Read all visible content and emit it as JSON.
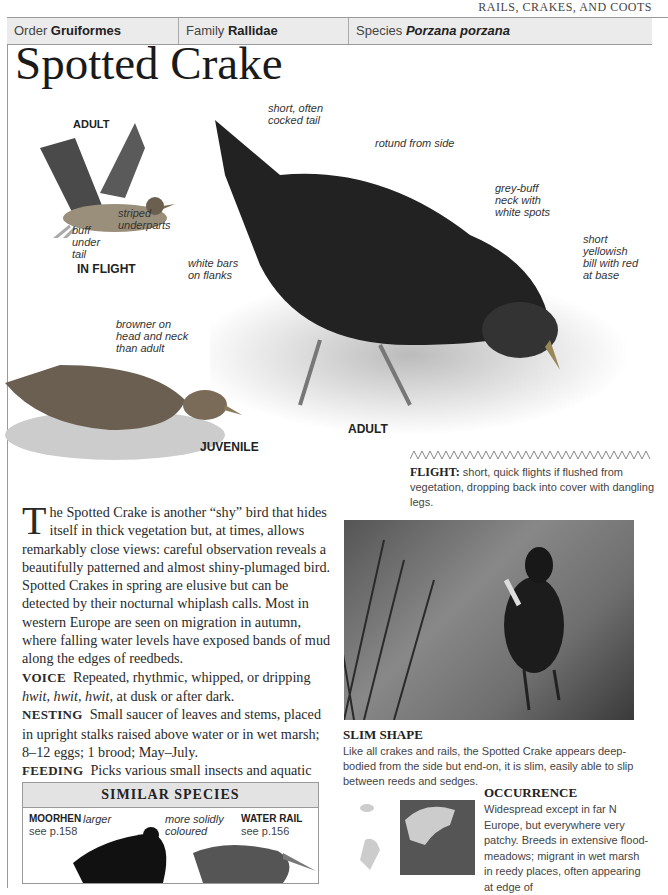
{
  "running_head": "RAILS, CRAKES, AND COOTS",
  "taxonomy": {
    "order_label": "Order",
    "order": "Gruiformes",
    "family_label": "Family",
    "family": "Rallidae",
    "species_label": "Species",
    "species": "Porzana porzana"
  },
  "title": "Spotted Crake",
  "illustrations": {
    "flight": {
      "top_label": "ADULT",
      "caption": "IN FLIGHT",
      "labels": [
        "striped underparts",
        "buff under tail"
      ]
    },
    "adult": {
      "caption": "ADULT",
      "labels": [
        "short, often cocked tail",
        "rotund from side",
        "grey-buff neck with white spots",
        "short yellowish bill with red at base",
        "white bars on flanks"
      ]
    },
    "juvenile": {
      "caption": "JUVENILE",
      "labels": [
        "browner on head and neck than adult"
      ]
    }
  },
  "flight": {
    "label": "FLIGHT:",
    "text": "short, quick flights if flushed from vegetation, dropping back into cover with dangling legs."
  },
  "description": {
    "dropcap": "T",
    "text": "he Spotted Crake is another “shy” bird that hides itself in thick vegetation but, at times, allows remarkably close views: careful observation reveals a beautifully patterned and almost shiny-plumaged bird. Spotted Crakes in spring are elusive but can be detected by their nocturnal whiplash calls. Most in western Europe are seen on migration in autumn, where falling water levels have exposed bands of mud along the edges of reedbeds.",
    "voice_label": "VOICE",
    "voice_call": "hwit, hwit, hwit,",
    "voice_pre": "Repeated, rhythmic, whipped, or dripping",
    "voice_post": "at dusk or after dark.",
    "nesting_label": "NESTING",
    "nesting": "Small saucer of leaves and stems, placed in upright stalks raised above water or in wet marsh; 8–12 eggs; 1 brood; May–July.",
    "feeding_label": "FEEDING",
    "feeding": "Picks various small insects and aquatic invertebrates from mud, foliage, and water."
  },
  "similar_species": {
    "heading": "SIMILAR SPECIES",
    "items": [
      {
        "name": "MOORHEN",
        "ref": "see p.158",
        "note": "larger"
      },
      {
        "name": "WATER RAIL",
        "ref": "see p.156",
        "note": "more solidly coloured"
      }
    ]
  },
  "slim_shape": {
    "title": "SLIM SHAPE",
    "text": "Like all crakes and rails, the Spotted Crake appears deep-bodied from the side but end-on, it is slim, easily able to slip between reeds and sedges."
  },
  "occurrence": {
    "title": "OCCURRENCE",
    "text": "Widespread except in far N Europe, but everywhere very patchy. Breeds in extensive flood-meadows; migrant in wet marsh in reedy places, often appearing at edge of"
  }
}
